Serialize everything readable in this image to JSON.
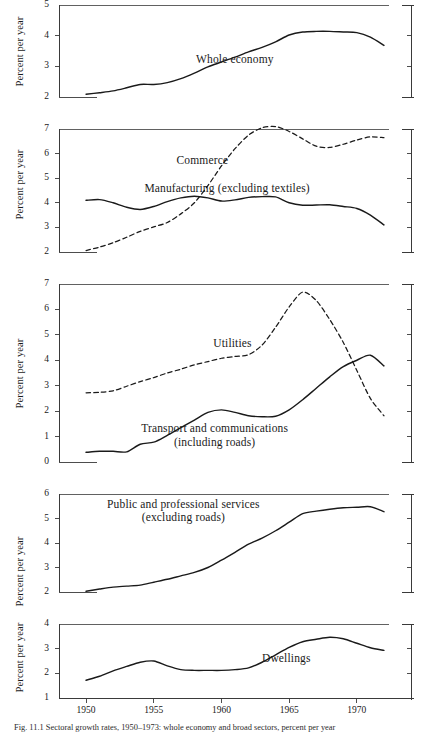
{
  "figure": {
    "ylabel": "Percent per year",
    "xtick_labels": [
      "1950",
      "1955",
      "1960",
      "1965",
      "1970"
    ],
    "xtick_values": [
      1950,
      1955,
      1960,
      1965,
      1970
    ],
    "caption": "Fig. 11.1  Sectoral growth rates, 1950–1973: whole economy and broad sectors, percent per year",
    "line_color": "#1a1a1a",
    "axis_color": "#3a3a3a"
  },
  "chart_data": [
    {
      "type": "line",
      "panel": 1,
      "title": "",
      "xlabel": "",
      "ylabel": "Percent per year",
      "xlim": [
        1948,
        1974
      ],
      "ylim": [
        2,
        5
      ],
      "yticks": [
        2,
        3,
        4,
        5
      ],
      "grid": false,
      "legend_position": "inline-label",
      "series": [
        {
          "name": "Whole economy",
          "style": "solid",
          "label_x": 1961,
          "label_y": 3.25,
          "x": [
            1950,
            1951,
            1952,
            1953,
            1954,
            1955,
            1956,
            1957,
            1958,
            1959,
            1960,
            1961,
            1962,
            1963,
            1964,
            1965,
            1966,
            1967,
            1968,
            1969,
            1970,
            1971,
            1972
          ],
          "values": [
            2.09,
            2.14,
            2.2,
            2.3,
            2.41,
            2.41,
            2.47,
            2.6,
            2.78,
            2.98,
            3.14,
            3.3,
            3.47,
            3.62,
            3.8,
            4.02,
            4.12,
            4.14,
            4.14,
            4.12,
            4.1,
            3.95,
            3.68
          ]
        }
      ]
    },
    {
      "type": "line",
      "panel": 2,
      "title": "",
      "xlabel": "",
      "ylabel": "Percent per year",
      "xlim": [
        1948,
        1974
      ],
      "ylim": [
        2,
        7
      ],
      "yticks": [
        2,
        3,
        4,
        5,
        6,
        7
      ],
      "grid": false,
      "legend_position": "inline-label",
      "series": [
        {
          "name": "Commerce",
          "style": "dashed",
          "label_x": 1958.6,
          "label_y": 5.72,
          "x": [
            1950,
            1951,
            1952,
            1953,
            1954,
            1955,
            1956,
            1957,
            1958,
            1959,
            1960,
            1961,
            1962,
            1963,
            1964,
            1965,
            1966,
            1967,
            1968,
            1969,
            1970,
            1971,
            1972
          ],
          "values": [
            2.06,
            2.2,
            2.38,
            2.6,
            2.84,
            3.02,
            3.2,
            3.55,
            4.0,
            4.7,
            5.5,
            6.2,
            6.75,
            7.05,
            7.1,
            6.9,
            6.6,
            6.3,
            6.25,
            6.38,
            6.55,
            6.68,
            6.65
          ]
        },
        {
          "name": "Manufacturing (excluding textiles)",
          "style": "solid",
          "label_x": 1960.4,
          "label_y": 4.62,
          "x": [
            1950,
            1951,
            1952,
            1953,
            1954,
            1955,
            1956,
            1957,
            1958,
            1959,
            1960,
            1961,
            1962,
            1963,
            1964,
            1965,
            1966,
            1967,
            1968,
            1969,
            1970,
            1971,
            1972
          ],
          "values": [
            4.1,
            4.13,
            4.0,
            3.82,
            3.73,
            3.85,
            4.05,
            4.2,
            4.27,
            4.2,
            4.07,
            4.12,
            4.22,
            4.25,
            4.24,
            4.0,
            3.9,
            3.91,
            3.92,
            3.85,
            3.77,
            3.5,
            3.1
          ]
        }
      ]
    },
    {
      "type": "line",
      "panel": 3,
      "title": "",
      "xlabel": "",
      "ylabel": "Percent per year",
      "xlim": [
        1948,
        1974
      ],
      "ylim": [
        0,
        7
      ],
      "yticks": [
        0,
        1,
        2,
        3,
        4,
        5,
        6,
        7
      ],
      "grid": false,
      "legend_position": "inline-label",
      "series": [
        {
          "name": "Utilities",
          "style": "dashed",
          "label_x": 1960.8,
          "label_y": 4.68,
          "x": [
            1950,
            1951,
            1952,
            1953,
            1954,
            1955,
            1956,
            1957,
            1958,
            1959,
            1960,
            1961,
            1962,
            1963,
            1964,
            1965,
            1966,
            1967,
            1968,
            1969,
            1970,
            1971,
            1972
          ],
          "values": [
            2.72,
            2.74,
            2.8,
            2.98,
            3.16,
            3.32,
            3.5,
            3.65,
            3.82,
            3.95,
            4.08,
            4.15,
            4.22,
            4.6,
            5.3,
            6.1,
            6.68,
            6.35,
            5.6,
            4.7,
            3.6,
            2.5,
            1.82
          ]
        },
        {
          "name": "Transport and communications (including roads)",
          "style": "solid",
          "label_x": 1959.5,
          "label_y": 1.04,
          "label_lines": [
            "Transport and communications",
            "(including roads)"
          ],
          "x": [
            1950,
            1951,
            1952,
            1953,
            1954,
            1955,
            1956,
            1957,
            1958,
            1959,
            1960,
            1961,
            1962,
            1963,
            1964,
            1965,
            1966,
            1967,
            1968,
            1969,
            1970,
            1971,
            1972
          ],
          "values": [
            0.38,
            0.42,
            0.42,
            0.4,
            0.7,
            0.78,
            1.05,
            1.35,
            1.65,
            1.95,
            2.05,
            1.95,
            1.82,
            1.78,
            1.8,
            2.05,
            2.45,
            2.9,
            3.35,
            3.75,
            4.0,
            4.2,
            3.78
          ]
        }
      ]
    },
    {
      "type": "line",
      "panel": 4,
      "title": "",
      "xlabel": "",
      "ylabel": "Percent per year",
      "xlim": [
        1948,
        1974
      ],
      "ylim": [
        2,
        6
      ],
      "yticks": [
        2,
        3,
        4,
        5,
        6
      ],
      "grid": false,
      "legend_position": "inline-label",
      "series": [
        {
          "name": "Public and professional services (excluding roads)",
          "style": "solid",
          "label_x": 1957.2,
          "label_y": 5.3,
          "label_lines": [
            "Public and professional services",
            "(excluding roads)"
          ],
          "x": [
            1950,
            1951,
            1952,
            1953,
            1954,
            1955,
            1956,
            1957,
            1958,
            1959,
            1960,
            1961,
            1962,
            1963,
            1964,
            1965,
            1966,
            1967,
            1968,
            1969,
            1970,
            1971,
            1972
          ],
          "values": [
            2.03,
            2.12,
            2.2,
            2.24,
            2.28,
            2.4,
            2.52,
            2.66,
            2.8,
            3.0,
            3.3,
            3.62,
            3.95,
            4.2,
            4.5,
            4.85,
            5.2,
            5.3,
            5.38,
            5.44,
            5.46,
            5.48,
            5.28
          ]
        }
      ]
    },
    {
      "type": "line",
      "panel": 5,
      "title": "",
      "xlabel": "",
      "ylabel": "Percent per year",
      "xlim": [
        1948,
        1974
      ],
      "ylim": [
        1,
        4
      ],
      "yticks": [
        1,
        2,
        3,
        4
      ],
      "grid": false,
      "legend_position": "inline-label",
      "series": [
        {
          "name": "Dwellings",
          "style": "solid",
          "label_x": 1964.8,
          "label_y": 2.62,
          "x": [
            1950,
            1951,
            1952,
            1953,
            1954,
            1955,
            1956,
            1957,
            1958,
            1959,
            1960,
            1961,
            1962,
            1963,
            1964,
            1965,
            1966,
            1967,
            1968,
            1969,
            1970,
            1971,
            1972
          ],
          "values": [
            1.72,
            1.88,
            2.1,
            2.28,
            2.45,
            2.5,
            2.3,
            2.15,
            2.12,
            2.12,
            2.12,
            2.15,
            2.22,
            2.45,
            2.75,
            3.05,
            3.28,
            3.38,
            3.46,
            3.4,
            3.22,
            3.04,
            2.93
          ]
        }
      ]
    }
  ]
}
